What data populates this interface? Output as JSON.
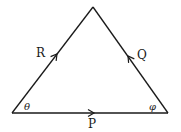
{
  "diagram": {
    "line_color": "#1a1a1a",
    "background": "#ffffff",
    "vertices": {
      "left": [
        12,
        113
      ],
      "apex": [
        93,
        7
      ],
      "right": [
        168,
        113
      ]
    },
    "sides": [
      {
        "id": "R",
        "label": "R",
        "from": "left",
        "to": "apex",
        "arrow_direction": "toward apex"
      },
      {
        "id": "Q",
        "label": "Q",
        "from": "right",
        "to": "apex",
        "arrow_direction": "toward apex"
      },
      {
        "id": "P",
        "label": "P",
        "from": "left",
        "to": "right",
        "arrow_direction": "toward right"
      }
    ],
    "angles": [
      {
        "id": "theta",
        "label": "θ",
        "vertex": "left"
      },
      {
        "id": "phi",
        "label": "φ",
        "vertex": "right"
      }
    ]
  }
}
